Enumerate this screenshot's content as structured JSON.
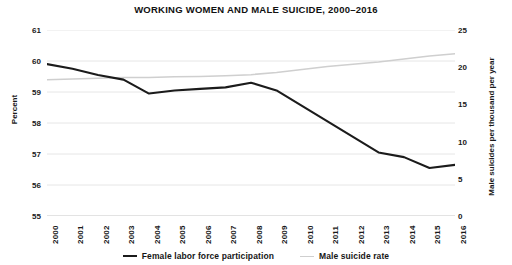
{
  "chart_data": {
    "type": "line",
    "title": "WORKING WOMEN AND MALE SUICIDE, 2000–2016",
    "xlabel": "",
    "ylabel": "Percent",
    "ylabel_right": "Male suicides per thousand per year",
    "categories": [
      "2000",
      "2001",
      "2002",
      "2003",
      "2004",
      "2005",
      "2006",
      "2007",
      "2008",
      "2009",
      "2010",
      "2011",
      "2012",
      "2013",
      "2014",
      "2015",
      "2016"
    ],
    "x": [
      2000,
      2001,
      2002,
      2003,
      2004,
      2005,
      2006,
      2007,
      2008,
      2009,
      2010,
      2011,
      2012,
      2013,
      2014,
      2015,
      2016
    ],
    "ylim": [
      55,
      61
    ],
    "ylim_right": [
      0,
      25
    ],
    "yticks": [
      "55",
      "56",
      "57",
      "58",
      "59",
      "60",
      "61"
    ],
    "yticks_right": [
      "0",
      "5",
      "10",
      "15",
      "20",
      "25"
    ],
    "grid": true,
    "legend_position": "bottom",
    "series": [
      {
        "name": "Female labor force participation",
        "axis": "left",
        "color": "#1b1b1b",
        "values": [
          59.9,
          59.75,
          59.55,
          59.4,
          58.95,
          59.05,
          59.1,
          59.15,
          59.3,
          59.05,
          58.55,
          58.05,
          57.55,
          57.05,
          56.9,
          56.55,
          56.65
        ]
      },
      {
        "name": "Male suicide rate",
        "axis": "right",
        "color": "#cfcfcf",
        "values": [
          18.3,
          18.4,
          18.5,
          18.6,
          18.6,
          18.7,
          18.75,
          18.85,
          19.0,
          19.3,
          19.7,
          20.1,
          20.4,
          20.7,
          21.1,
          21.5,
          21.8
        ]
      }
    ]
  },
  "legend": {
    "items": [
      {
        "label": "Female labor force participation"
      },
      {
        "label": "Male suicide rate"
      }
    ]
  }
}
